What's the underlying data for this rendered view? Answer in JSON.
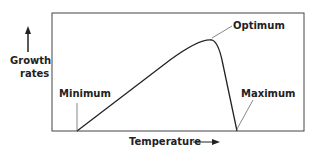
{
  "diagram": {
    "y_axis_label_line1": "Growth",
    "y_axis_label_line2": "rates",
    "x_axis_label": "Temperature",
    "points": {
      "minimum": "Minimum",
      "optimum": "Optimum",
      "maximum": "Maximum"
    },
    "line_color": "#222222"
  }
}
